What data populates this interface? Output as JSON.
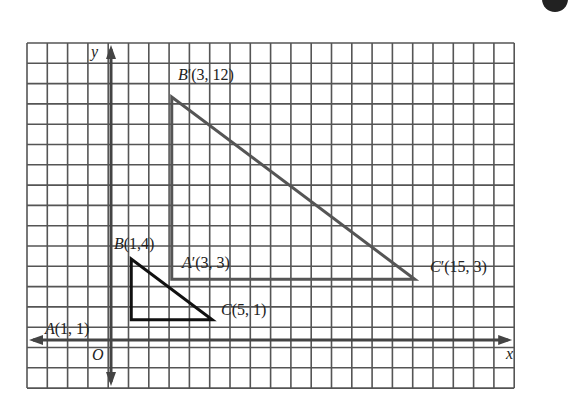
{
  "figure": {
    "type": "coordinate-grid-dilation",
    "axes": {
      "x_label": "x",
      "y_label": "y",
      "origin_label": "O"
    },
    "grid": {
      "cols": 24,
      "rows": 17,
      "left": 27,
      "top": 43,
      "cell": 20.3,
      "origin_px": [
        111,
        340
      ],
      "unit_px": 20.25
    },
    "triangles": [
      {
        "name": "ABC",
        "vertices": [
          {
            "label": "A",
            "prime": "",
            "coords": "(1, 1)",
            "grid": [
              1,
              1
            ]
          },
          {
            "label": "B",
            "prime": "",
            "coords": "(1,4)",
            "grid": [
              1,
              4
            ]
          },
          {
            "label": "C",
            "prime": "",
            "coords": "(5, 1)",
            "grid": [
              5,
              1
            ]
          }
        ]
      },
      {
        "name": "A'B'C'",
        "vertices": [
          {
            "label": "A",
            "prime": "′",
            "coords": "(3, 3)",
            "grid": [
              3,
              3
            ]
          },
          {
            "label": "B",
            "prime": "′",
            "coords": "(3, 12)",
            "grid": [
              3,
              12
            ]
          },
          {
            "label": "C",
            "prime": "′",
            "coords": "(15, 3)",
            "grid": [
              15,
              3
            ]
          }
        ]
      }
    ],
    "colors": {
      "grid": "#555555",
      "axis": "#444444",
      "small_triangle": "#111111",
      "large_triangle": "#555555",
      "text": "#222222"
    }
  }
}
